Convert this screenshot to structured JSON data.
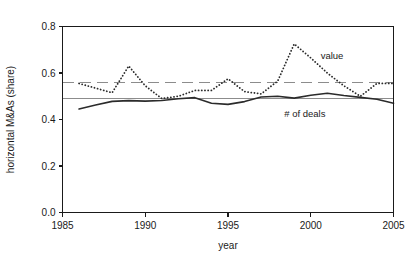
{
  "figure": {
    "background": "#ffffff",
    "foreground": "#1a1a1a"
  },
  "chart_data": {
    "type": "line",
    "title": "",
    "xlabel": "year",
    "ylabel": "horizontal M&As (share)",
    "xlim": [
      1985,
      2005
    ],
    "ylim": [
      0.0,
      0.8
    ],
    "xticks": [
      1985,
      1990,
      1995,
      2000,
      2005
    ],
    "xtick_labels": [
      "1985",
      "1990",
      "1995",
      "2000",
      "2005"
    ],
    "yticks": [
      0.0,
      0.2,
      0.4,
      0.6,
      0.8
    ],
    "ytick_labels": [
      "0.0",
      "0.2",
      "0.4",
      "0.6",
      "0.8"
    ],
    "grid": false,
    "legend_position": "inline-annotation",
    "x": [
      1986,
      1987,
      1988,
      1989,
      1990,
      1991,
      1992,
      1993,
      1994,
      1995,
      1996,
      1997,
      1998,
      1999,
      2000,
      2001,
      2002,
      2003,
      2004,
      2005
    ],
    "series": [
      {
        "name": "value",
        "label": "value",
        "style": "dotted",
        "color": "#2b2b2b",
        "reference_line": 0.56,
        "reference_style": "dashed",
        "reference_color": "#8c8c8c",
        "values": [
          0.555,
          0.535,
          0.515,
          0.63,
          0.545,
          0.49,
          0.5,
          0.525,
          0.525,
          0.575,
          0.52,
          0.51,
          0.565,
          0.725,
          0.665,
          0.6,
          0.545,
          0.5,
          0.555,
          0.555
        ]
      },
      {
        "name": "number-of-deals",
        "label": "# of deals",
        "style": "solid",
        "color": "#2b2b2b",
        "reference_line": 0.49,
        "reference_style": "solid",
        "reference_color": "#8c8c8c",
        "values": [
          0.445,
          0.462,
          0.478,
          0.481,
          0.479,
          0.482,
          0.489,
          0.494,
          0.47,
          0.465,
          0.477,
          0.497,
          0.5,
          0.492,
          0.504,
          0.513,
          0.503,
          0.495,
          0.487,
          0.47
        ]
      }
    ],
    "annotations": [
      {
        "name": "value-annotation",
        "text": "value",
        "x": 2000.6,
        "y": 0.676
      },
      {
        "name": "deals-annotation",
        "text": "# of deals",
        "x": 1998.4,
        "y": 0.427
      }
    ]
  }
}
